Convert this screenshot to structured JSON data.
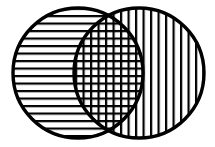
{
  "figure": {
    "title": "Two overlapping circles Venn diagram",
    "type": "venn-diagram",
    "background_color": "#ffffff",
    "stroke_color": "#000000",
    "hatch_color": "#000000",
    "canvas": {
      "width": 215,
      "height": 147
    }
  },
  "chart_data": {
    "type": "diagram",
    "title": "Two overlapping circles Venn diagram",
    "sets": [
      {
        "name": "left-set",
        "fill_pattern": "horizontal-lines",
        "cx": 78,
        "cy": 73,
        "r": 65,
        "stroke_width": 3
      },
      {
        "name": "right-set",
        "fill_pattern": "vertical-lines",
        "cx": 139,
        "cy": 73,
        "r": 65,
        "stroke_width": 3
      }
    ],
    "intersection": {
      "name": "intersection-region",
      "fill_pattern": "cross-hatch",
      "shape": "lens"
    },
    "hatch_spacing_px": 7.5,
    "hatch_line_width_px": 2.2
  },
  "regions": {
    "left_only_label": "",
    "right_only_label": "",
    "intersection_label": ""
  }
}
